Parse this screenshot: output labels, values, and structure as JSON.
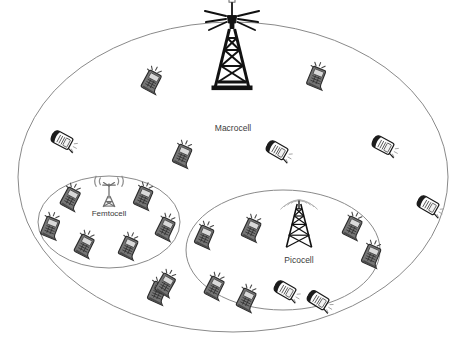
{
  "diagram": {
    "background_color": "#ffffff",
    "stroke_color": "#8a8a8a",
    "label_color": "#3b3b3b",
    "phone_dark_color": "#6e6e6e",
    "phone_light_color": "#fdfdfd",
    "tower_color": "#111111"
  },
  "cells": [
    {
      "id": "macrocell",
      "label": "Macrocell",
      "label_x": 233,
      "label_y": 131,
      "label_size": 8.5,
      "ellipse": {
        "cx": 233,
        "cy": 177,
        "rx": 215,
        "ry": 155
      },
      "tower": {
        "x": 232,
        "y": 42,
        "scale": 1.0,
        "type": "macro-tower"
      }
    },
    {
      "id": "femtocell",
      "label": "Femtocell",
      "label_x": 109,
      "label_y": 216,
      "label_size": 8.0,
      "ellipse": {
        "cx": 109,
        "cy": 222,
        "rx": 71,
        "ry": 46
      },
      "tower": {
        "x": 109,
        "y": 196,
        "scale": 0.42,
        "type": "femto-tower"
      }
    },
    {
      "id": "picocell",
      "label": "Picocell",
      "label_x": 299,
      "label_y": 263,
      "label_size": 8.5,
      "ellipse": {
        "cx": 283,
        "cy": 250,
        "rx": 97,
        "ry": 60
      },
      "tower": {
        "x": 299,
        "y": 222,
        "scale": 0.6,
        "type": "pico-tower"
      }
    }
  ],
  "phones": [
    {
      "name": "phone-macro-nw-upper",
      "x": 151,
      "y": 82,
      "rot": 28,
      "style": "dark",
      "cell": "macrocell"
    },
    {
      "name": "phone-macro-ne-upper",
      "x": 316,
      "y": 78,
      "rot": 22,
      "style": "dark",
      "cell": "macrocell"
    },
    {
      "name": "phone-macro-w-left",
      "x": 62,
      "y": 140,
      "rot": 118,
      "style": "light",
      "cell": "macrocell"
    },
    {
      "name": "phone-macro-center-l",
      "x": 182,
      "y": 156,
      "rot": 24,
      "style": "dark",
      "cell": "macrocell"
    },
    {
      "name": "phone-macro-center-r",
      "x": 277,
      "y": 150,
      "rot": 120,
      "style": "light",
      "cell": "macrocell"
    },
    {
      "name": "phone-macro-e-right",
      "x": 383,
      "y": 145,
      "rot": 118,
      "style": "light",
      "cell": "macrocell"
    },
    {
      "name": "phone-macro-far-e",
      "x": 428,
      "y": 205,
      "rot": 120,
      "style": "light",
      "cell": "macrocell"
    },
    {
      "name": "phone-macro-sw",
      "x": 157,
      "y": 293,
      "rot": 24,
      "style": "dark",
      "cell": "macrocell"
    },
    {
      "name": "phone-macro-s-mid",
      "x": 246,
      "y": 300,
      "rot": 26,
      "style": "dark",
      "cell": "macrocell"
    },
    {
      "name": "phone-macro-se",
      "x": 318,
      "y": 300,
      "rot": 122,
      "style": "light",
      "cell": "macrocell"
    },
    {
      "name": "phone-femto-nw",
      "x": 70,
      "y": 199,
      "rot": 28,
      "style": "dark",
      "cell": "femtocell"
    },
    {
      "name": "phone-femto-ne",
      "x": 143,
      "y": 198,
      "rot": 24,
      "style": "dark",
      "cell": "femtocell"
    },
    {
      "name": "phone-femto-w",
      "x": 50,
      "y": 228,
      "rot": 22,
      "style": "dark",
      "cell": "femtocell"
    },
    {
      "name": "phone-femto-e",
      "x": 165,
      "y": 229,
      "rot": 26,
      "style": "dark",
      "cell": "femtocell"
    },
    {
      "name": "phone-femto-sw",
      "x": 84,
      "y": 246,
      "rot": 27,
      "style": "dark",
      "cell": "femtocell"
    },
    {
      "name": "phone-femto-se",
      "x": 128,
      "y": 248,
      "rot": 25,
      "style": "dark",
      "cell": "femtocell"
    },
    {
      "name": "phone-femto-edge-s",
      "x": 165,
      "y": 285,
      "rot": 30,
      "style": "dark",
      "cell": "femtocell"
    },
    {
      "name": "phone-pico-w",
      "x": 204,
      "y": 237,
      "rot": 24,
      "style": "dark",
      "cell": "picocell"
    },
    {
      "name": "phone-pico-nw",
      "x": 251,
      "y": 230,
      "rot": 25,
      "style": "dark",
      "cell": "picocell"
    },
    {
      "name": "phone-pico-ne",
      "x": 352,
      "y": 228,
      "rot": 26,
      "style": "dark",
      "cell": "picocell"
    },
    {
      "name": "phone-pico-e",
      "x": 371,
      "y": 256,
      "rot": 24,
      "style": "dark",
      "cell": "picocell"
    },
    {
      "name": "phone-pico-sw",
      "x": 214,
      "y": 288,
      "rot": 27,
      "style": "dark",
      "cell": "picocell"
    },
    {
      "name": "phone-pico-s",
      "x": 285,
      "y": 290,
      "rot": 120,
      "style": "light",
      "cell": "picocell"
    }
  ]
}
